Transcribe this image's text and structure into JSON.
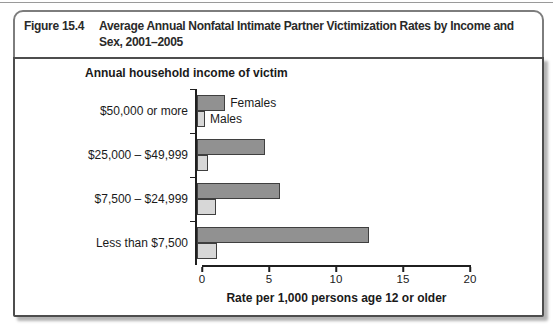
{
  "figure": {
    "label": "Figure 15.4",
    "title": "Average Annual Nonfatal Intimate Partner Victimization Rates by Income and Sex, 2001–2005"
  },
  "chart_data": {
    "type": "bar",
    "orientation": "horizontal",
    "axis_title": "Annual household income of victim",
    "xlabel": "Rate per 1,000 persons age 12 or older",
    "xlim": [
      0,
      20
    ],
    "xticks": [
      0,
      5,
      10,
      15,
      20
    ],
    "grid": false,
    "legend_position": "inline-first-group",
    "categories": [
      "$50,000 or more",
      "$25,000 – $49,999",
      "$7,500 – $24,999",
      "Less than $7,500"
    ],
    "series": [
      {
        "name": "Females",
        "color": "#919191",
        "values": [
          2.1,
          5.1,
          6.2,
          12.8
        ]
      },
      {
        "name": "Males",
        "color": "#d7d7d7",
        "values": [
          0.6,
          0.8,
          1.4,
          1.5
        ]
      }
    ],
    "bar_border_color": "#3f3f3f",
    "axis_color": "#1f1f1f"
  },
  "colors": {
    "frame_border": "#7d7d7d",
    "panel_border": "#4d4d4d",
    "panel_shadow": "#b3b3b3",
    "background": "#ffffff"
  }
}
